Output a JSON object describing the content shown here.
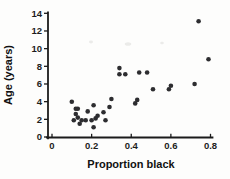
{
  "figure": {
    "background_color": "#fdfdfc",
    "point_color": "#2d2d30",
    "axis_color": "#1b1b1b"
  },
  "chart_data": {
    "type": "scatter",
    "title": "",
    "xlabel": "Proportion black",
    "ylabel": "Age (years)",
    "xlim": [
      0,
      0.8
    ],
    "ylim": [
      0,
      14
    ],
    "grid": false,
    "legend": null,
    "x_ticks": [
      0,
      0.2,
      0.4,
      0.6,
      0.8
    ],
    "x_tick_labels": [
      "0",
      "0.2",
      "0.4",
      "0.6",
      "0.8"
    ],
    "y_ticks": [
      0,
      2,
      4,
      6,
      8,
      10,
      12,
      14
    ],
    "y_tick_labels": [
      "0",
      "2",
      "4",
      "6",
      "8",
      "10",
      "12",
      "14"
    ],
    "series": [
      {
        "name": "lion noses",
        "marker": "circle",
        "color": "#2d2d30",
        "points": [
          [
            0.21,
            1.1
          ],
          [
            0.14,
            1.5
          ],
          [
            0.11,
            1.9
          ],
          [
            0.13,
            2.2
          ],
          [
            0.12,
            2.6
          ],
          [
            0.13,
            3.2
          ],
          [
            0.12,
            3.2
          ],
          [
            0.18,
            2.9
          ],
          [
            0.23,
            2.4
          ],
          [
            0.22,
            2.1
          ],
          [
            0.2,
            1.9
          ],
          [
            0.17,
            1.9
          ],
          [
            0.15,
            1.9
          ],
          [
            0.27,
            1.9
          ],
          [
            0.26,
            2.8
          ],
          [
            0.21,
            3.6
          ],
          [
            0.3,
            4.3
          ],
          [
            0.42,
            3.8
          ],
          [
            0.43,
            4.2
          ],
          [
            0.59,
            5.4
          ],
          [
            0.6,
            5.8
          ],
          [
            0.72,
            6.0
          ],
          [
            0.29,
            3.4
          ],
          [
            0.1,
            4.0
          ],
          [
            0.48,
            7.3
          ],
          [
            0.44,
            7.3
          ],
          [
            0.34,
            7.8
          ],
          [
            0.37,
            7.1
          ],
          [
            0.34,
            7.1
          ],
          [
            0.74,
            13.1
          ],
          [
            0.79,
            8.8
          ],
          [
            0.51,
            5.4
          ]
        ]
      }
    ]
  }
}
